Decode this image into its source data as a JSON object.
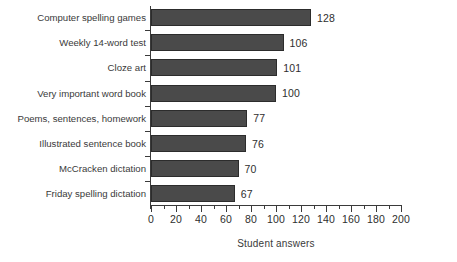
{
  "chart_data": {
    "type": "bar",
    "orientation": "horizontal",
    "title": "",
    "xlabel": "Student answers",
    "ylabel": "",
    "xlim": [
      0,
      200
    ],
    "xticks": [
      0,
      20,
      40,
      60,
      80,
      100,
      120,
      140,
      160,
      180,
      200
    ],
    "minor_tick_step": 10,
    "grid": false,
    "legend": null,
    "bar_color": "#4a4a4a",
    "categories": [
      "Computer spelling games",
      "Weekly 14-word test",
      "Cloze art",
      "Very important word book",
      "Poems, sentences, homework",
      "Illustrated sentence book",
      "McCracken dictation",
      "Friday spelling dictation"
    ],
    "values": [
      128,
      106,
      101,
      100,
      77,
      76,
      70,
      67
    ],
    "value_labels": [
      "128",
      "106",
      "101",
      "100",
      "77",
      "76",
      "70",
      "67"
    ],
    "tick_labels": [
      "0",
      "20",
      "40",
      "60",
      "80",
      "100",
      "120",
      "140",
      "160",
      "180",
      "200"
    ]
  }
}
